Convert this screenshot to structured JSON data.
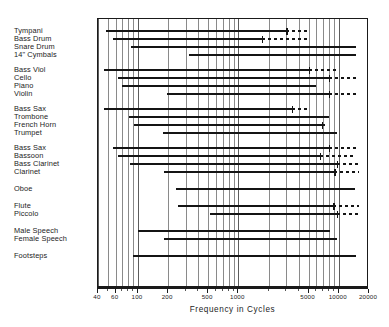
{
  "chart_data": {
    "type": "bar",
    "title": "",
    "xlabel": "Frequency in Cycles",
    "ylabel": "",
    "xscale": "log",
    "xlim": [
      40,
      20000
    ],
    "grid": true,
    "legend": null,
    "tick_labels": [
      "40",
      "60",
      "100",
      "200",
      "500",
      "1000",
      "5000",
      "10000",
      "20000"
    ],
    "tick_values": [
      40,
      60,
      100,
      200,
      500,
      1000,
      5000,
      10000,
      20000
    ],
    "categories": [
      "Tympani",
      "Bass Drum",
      "Snare Drum",
      "14\" Cymbals",
      "Bass Viol",
      "Cello",
      "Piano",
      "Violin",
      "Bass Sax",
      "Trombone",
      "French Horn",
      "Trumpet",
      "Bass Sax",
      "Bassoon",
      "Bass Clarinet",
      "Clarinet",
      "Oboe",
      "Flute",
      "Piccolo",
      "Male Speech",
      "Female Speech",
      "Footsteps"
    ],
    "groups": [
      {
        "name": "percussion",
        "rows": [
          "Tympani",
          "Bass Drum",
          "Snare Drum",
          "14\" Cymbals"
        ]
      },
      {
        "name": "strings",
        "rows": [
          "Bass Viol",
          "Cello",
          "Piano",
          "Violin"
        ]
      },
      {
        "name": "brass",
        "rows": [
          "Bass Sax",
          "Trombone",
          "French Horn",
          "Trumpet"
        ]
      },
      {
        "name": "woodwinds",
        "rows": [
          "Bass Sax",
          "Bassoon",
          "Bass Clarinet",
          "Clarinet"
        ]
      },
      {
        "name": "oboe",
        "rows": [
          "Oboe"
        ]
      },
      {
        "name": "flutes",
        "rows": [
          "Flute",
          "Piccolo"
        ]
      },
      {
        "name": "speech",
        "rows": [
          "Male Speech",
          "Female Speech"
        ]
      },
      {
        "name": "other",
        "rows": [
          "Footsteps"
        ]
      }
    ],
    "series": [
      {
        "name": "Tympani",
        "solid": [
          48,
          3000
        ],
        "dotted": [
          3000,
          5000
        ],
        "group": 0,
        "row": 0
      },
      {
        "name": "Bass Drum",
        "solid": [
          56,
          1700
        ],
        "dotted": [
          1700,
          5000
        ],
        "group": 0,
        "row": 1
      },
      {
        "name": "Snare Drum",
        "solid": [
          86,
          15000
        ],
        "dotted": null,
        "group": 0,
        "row": 2
      },
      {
        "name": "14\" Cymbals",
        "solid": [
          320,
          15000
        ],
        "dotted": null,
        "group": 0,
        "row": 3
      },
      {
        "name": "Bass Viol",
        "solid": [
          46,
          5000
        ],
        "dotted": [
          5000,
          9500
        ],
        "group": 1,
        "row": 0
      },
      {
        "name": "Cello",
        "solid": [
          64,
          8000
        ],
        "dotted": [
          8000,
          16000
        ],
        "group": 1,
        "row": 1
      },
      {
        "name": "Piano",
        "solid": [
          70,
          6000
        ],
        "dotted": null,
        "group": 1,
        "row": 2
      },
      {
        "name": "Violin",
        "solid": [
          196,
          8000
        ],
        "dotted": [
          8000,
          16000
        ],
        "group": 1,
        "row": 3
      },
      {
        "name": "Bass Sax",
        "solid": [
          46,
          3400
        ],
        "dotted": [
          3400,
          5200
        ],
        "group": 2,
        "row": 0
      },
      {
        "name": "Trombone",
        "solid": [
          82,
          8000
        ],
        "dotted": null,
        "group": 2,
        "row": 1
      },
      {
        "name": "French Horn",
        "solid": [
          92,
          6800
        ],
        "dotted": [
          6800,
          7800
        ],
        "group": 2,
        "row": 2
      },
      {
        "name": "Trumpet",
        "solid": [
          178,
          9600
        ],
        "dotted": null,
        "group": 2,
        "row": 3
      },
      {
        "name": "Bass Sax",
        "solid": [
          56,
          8000
        ],
        "dotted": [
          8000,
          16000
        ],
        "group": 3,
        "row": 0
      },
      {
        "name": "Bassoon",
        "solid": [
          64,
          6500
        ],
        "dotted": [
          6500,
          15000
        ],
        "group": 3,
        "row": 1
      },
      {
        "name": "Bass Clarinet",
        "solid": [
          84,
          9600
        ],
        "dotted": [
          9600,
          16000
        ],
        "group": 3,
        "row": 2
      },
      {
        "name": "Clarinet",
        "solid": [
          180,
          9000
        ],
        "dotted": [
          9000,
          16000
        ],
        "group": 3,
        "row": 3
      },
      {
        "name": "Oboe",
        "solid": [
          240,
          14500
        ],
        "dotted": null,
        "group": 4,
        "row": 0
      },
      {
        "name": "Flute",
        "solid": [
          250,
          8800
        ],
        "dotted": [
          8800,
          16000
        ],
        "group": 5,
        "row": 0
      },
      {
        "name": "Piccolo",
        "solid": [
          520,
          9600
        ],
        "dotted": [
          9600,
          16000
        ],
        "group": 5,
        "row": 1
      },
      {
        "name": "Male Speech",
        "solid": [
          100,
          8200
        ],
        "dotted": null,
        "group": 6,
        "row": 0
      },
      {
        "name": "Female Speech",
        "solid": [
          180,
          9600
        ],
        "dotted": null,
        "group": 6,
        "row": 1
      },
      {
        "name": "Footsteps",
        "solid": [
          90,
          15000
        ],
        "dotted": null,
        "group": 7,
        "row": 0
      }
    ],
    "gridlines": [
      40,
      50,
      60,
      70,
      80,
      90,
      100,
      200,
      300,
      400,
      500,
      600,
      700,
      800,
      900,
      1000,
      2000,
      3000,
      4000,
      5000,
      6000,
      7000,
      8000,
      9000,
      10000,
      20000
    ],
    "row_labels": [
      {
        "text": "Tympani",
        "y": 9
      },
      {
        "text": "Bass Drum",
        "y": 17
      },
      {
        "text": "Snare Drum",
        "y": 25
      },
      {
        "text": "14\" Cymbals",
        "y": 33
      },
      {
        "text": "Bass Viol",
        "y": 48
      },
      {
        "text": "Cello",
        "y": 56
      },
      {
        "text": "Piano",
        "y": 64
      },
      {
        "text": "Violin",
        "y": 72
      },
      {
        "text": "Bass Sax",
        "y": 87
      },
      {
        "text": "Trombone",
        "y": 95
      },
      {
        "text": "French Horn",
        "y": 103
      },
      {
        "text": "Trumpet",
        "y": 111
      },
      {
        "text": "Bass Sax",
        "y": 126
      },
      {
        "text": "Bassoon",
        "y": 134
      },
      {
        "text": "Bass Clarinet",
        "y": 142
      },
      {
        "text": "Clarinet",
        "y": 150
      },
      {
        "text": "Oboe",
        "y": 167
      },
      {
        "text": "Flute",
        "y": 184
      },
      {
        "text": "Piccolo",
        "y": 192
      },
      {
        "text": "Male Speech",
        "y": 209
      },
      {
        "text": "Female Speech",
        "y": 217
      },
      {
        "text": "Footsteps",
        "y": 234
      }
    ]
  },
  "axis": {
    "title": "Frequency in Cycles",
    "ticks": [
      {
        "value": 40,
        "label": "40"
      },
      {
        "value": 60,
        "label": "60"
      },
      {
        "value": 100,
        "label": "100"
      },
      {
        "value": 200,
        "label": "200"
      },
      {
        "value": 500,
        "label": "500"
      },
      {
        "value": 1000,
        "label": "1000"
      },
      {
        "value": 5000,
        "label": "5000"
      },
      {
        "value": 10000,
        "label": "10000"
      },
      {
        "value": 20000,
        "label": "20000"
      }
    ]
  }
}
